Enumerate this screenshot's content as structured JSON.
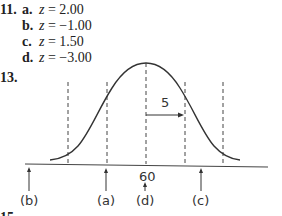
{
  "problems": {
    "p11": {
      "number": "11.",
      "parts": [
        {
          "letter": "a.",
          "var": "z",
          "eq": " = 2.00"
        },
        {
          "letter": "b.",
          "var": "z",
          "eq": " = −1.00"
        },
        {
          "letter": "c.",
          "var": "z",
          "eq": " = 1.50"
        },
        {
          "letter": "d.",
          "var": "z",
          "eq": " = −3.00"
        }
      ]
    },
    "p13": {
      "number": "13.",
      "figure": {
        "type": "normal-distribution",
        "mean_label": "60",
        "sd_label": "5",
        "markers": [
          {
            "label": "(b)"
          },
          {
            "label": "(a)"
          },
          {
            "label": "(d)"
          },
          {
            "label": "(c)"
          }
        ]
      }
    },
    "p15": {
      "number": "15."
    }
  }
}
